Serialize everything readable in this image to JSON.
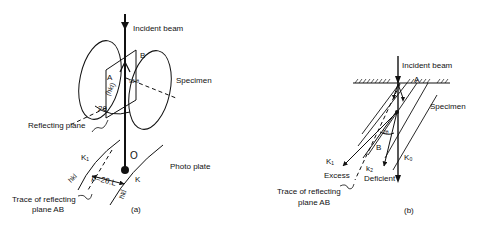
{
  "panel_a": {
    "caption": "(a)",
    "labels": {
      "incident_beam": "Incident beam",
      "specimen": "Specimen",
      "point_a": "A",
      "point_b": "B",
      "angle_90": "90-θ",
      "plane_hkl": "(hkl)",
      "angle_2theta": "2θ",
      "reflecting_plane": "Reflecting plane",
      "k1": "K₁",
      "k": "K",
      "origin": "O",
      "photo_plate": "Photo plate",
      "hkl": "hkl",
      "hkl_bar": "h̄k̄l̄",
      "distance": "p=2θ.L",
      "trace_line1": "Trace of reflecting",
      "trace_line2": "plane AB"
    }
  },
  "panel_b": {
    "caption": "(b)",
    "labels": {
      "incident_beam": "Incident beam",
      "point_a": "A",
      "specimen": "Specimen",
      "angle_2theta": "2θ",
      "point_b": "B",
      "k1": "K₁",
      "excess": "Excess",
      "k2": "k₂",
      "deficient": "Deficient",
      "k0": "K₀",
      "trace_line1": "Trace of reflecting",
      "trace_line2": "plane AB"
    }
  }
}
